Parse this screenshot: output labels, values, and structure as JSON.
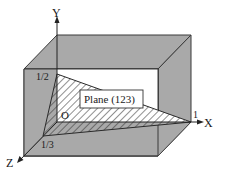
{
  "diagram": {
    "axes": {
      "x_label": "X",
      "y_label": "Y",
      "z_label": "Z",
      "origin_label": "O"
    },
    "intercepts": {
      "x": "1",
      "y": "1/2",
      "z": "1/3"
    },
    "plane_label": "Plane (123)",
    "colors": {
      "cube_fill": "#a9a9a9",
      "cube_edge": "#3a3a3a",
      "window_fill": "#ffffff",
      "hatch": "#333333",
      "text": "#1a1a1a"
    }
  }
}
